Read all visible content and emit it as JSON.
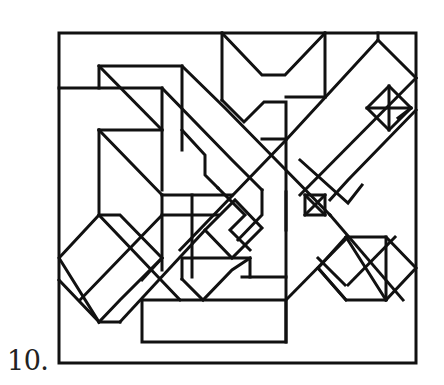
{
  "figure": {
    "label": "10.",
    "stroke_color": "#111111",
    "background": "#ffffff"
  }
}
